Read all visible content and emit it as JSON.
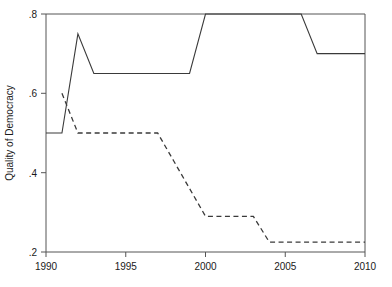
{
  "chart_data": {
    "type": "line",
    "title": "",
    "xlabel": "",
    "ylabel": "Quality of Democracy",
    "xlim": [
      1990,
      2010
    ],
    "ylim": [
      0.2,
      0.8
    ],
    "grid": false,
    "legend": "none",
    "x_ticks": [
      1990,
      1995,
      2000,
      2005,
      2010
    ],
    "x_tick_labels": [
      "1990",
      "1995",
      "2000",
      "2005",
      "2010"
    ],
    "y_ticks": [
      0.2,
      0.4,
      0.6,
      0.8
    ],
    "y_tick_labels": [
      ".2",
      ".4",
      ".6",
      ".8"
    ],
    "series": [
      {
        "name": "solid-series",
        "style": "solid",
        "color": "#3a3a3a",
        "x": [
          1990,
          1991,
          1992,
          1993,
          1994,
          1995,
          1996,
          1997,
          1998,
          1999,
          2000,
          2001,
          2002,
          2003,
          2004,
          2005,
          2006,
          2007,
          2008,
          2009,
          2010
        ],
        "values": [
          0.5,
          0.5,
          0.75,
          0.65,
          0.65,
          0.65,
          0.65,
          0.65,
          0.65,
          0.65,
          0.8,
          0.8,
          0.8,
          0.8,
          0.8,
          0.8,
          0.8,
          0.7,
          0.7,
          0.7,
          0.7
        ]
      },
      {
        "name": "dashed-series",
        "style": "dashed",
        "color": "#3a3a3a",
        "x": [
          1991,
          1992,
          1993,
          1994,
          1995,
          1996,
          1997,
          1998,
          1999,
          2000,
          2001,
          2002,
          2003,
          2004,
          2005,
          2006,
          2007,
          2008,
          2009,
          2010
        ],
        "values": [
          0.6,
          0.5,
          0.5,
          0.5,
          0.5,
          0.5,
          0.5,
          0.43,
          0.36,
          0.29,
          0.29,
          0.29,
          0.29,
          0.225,
          0.225,
          0.225,
          0.225,
          0.225,
          0.225,
          0.225
        ]
      }
    ]
  },
  "axis": {
    "y_title": "Quality of Democracy",
    "y_tick_0": ".8",
    "y_tick_1": ".6",
    "y_tick_2": ".4",
    "y_tick_3": ".2",
    "x_tick_0": "1990",
    "x_tick_1": "1995",
    "x_tick_2": "2000",
    "x_tick_3": "2005",
    "x_tick_4": "2010"
  }
}
